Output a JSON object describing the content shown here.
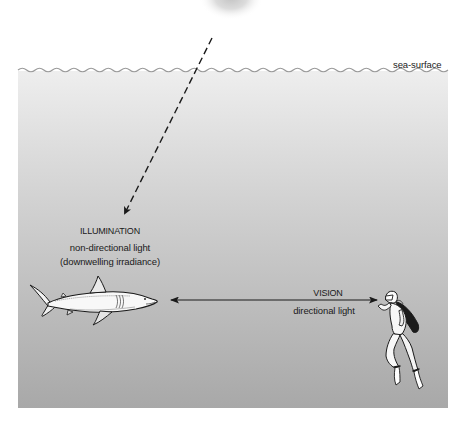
{
  "diagram": {
    "labels": {
      "sea_surface": "sea-surface",
      "illumination_title": "ILLUMINATION",
      "illumination_line1": "non-directional light",
      "illumination_line2": "(downwelling irradiance)",
      "vision_title": "VISION",
      "vision_subtitle": "directional light"
    },
    "elements": {
      "sun": "sun-glow",
      "sea_surface_line": "wavy-sea-surface",
      "illumination_arrow": "dashed-arrow-downward",
      "vision_arrow": "double-headed-arrow",
      "shark": "shark-illustration",
      "diver": "scuba-diver-illustration"
    },
    "colors": {
      "water_top": "#ececec",
      "water_bottom": "#a9a9a9",
      "wave_line": "#9a9a9a",
      "ink": "#1a1a1a",
      "sun": "#c8c8c8"
    }
  }
}
